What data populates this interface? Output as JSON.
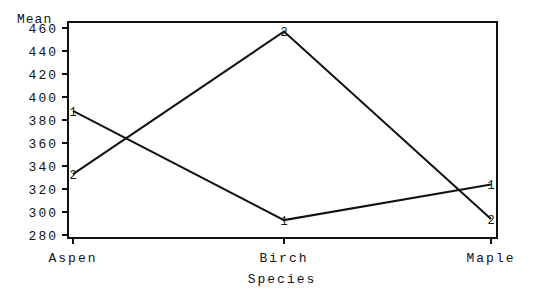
{
  "chart_data": {
    "type": "line",
    "title": "",
    "xlabel": "Species",
    "ylabel": "Mean",
    "categories": [
      "Aspen",
      "Birch",
      "Maple"
    ],
    "series": [
      {
        "name": "1",
        "marker": "1",
        "values": [
          388,
          293,
          324
        ]
      },
      {
        "name": "2",
        "marker": "2",
        "values": [
          333,
          457,
          294
        ]
      }
    ],
    "yticks": [
      280,
      300,
      320,
      340,
      360,
      380,
      400,
      420,
      440,
      460
    ],
    "ylim": [
      278,
      463
    ],
    "grid": false,
    "legend": "none"
  }
}
